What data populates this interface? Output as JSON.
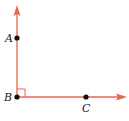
{
  "diagram": {
    "type": "right-angle",
    "ray_color": "#E8664A",
    "point_color": "#111111",
    "points": {
      "A": {
        "label": "A"
      },
      "B": {
        "label": "B"
      },
      "C": {
        "label": "C"
      }
    },
    "rays": [
      {
        "from": "B",
        "through": "A",
        "direction": "up"
      },
      {
        "from": "B",
        "through": "C",
        "direction": "right"
      }
    ],
    "right_angle_marker_at": "B"
  }
}
